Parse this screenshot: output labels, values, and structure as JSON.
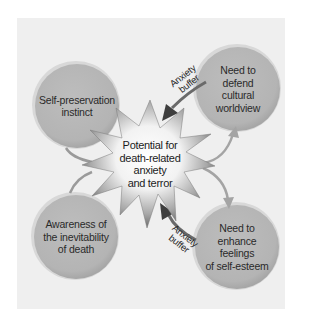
{
  "diagram": {
    "center": {
      "label": "Potential for death-related anxiety and terror",
      "lines": [
        "Potential for",
        "death-related",
        "anxiety",
        "and terror"
      ]
    },
    "nodes": [
      {
        "id": "self-preservation",
        "lines": [
          "Self-preservation",
          "instinct"
        ]
      },
      {
        "id": "awareness-death",
        "lines": [
          "Awareness of",
          "the inevitability",
          "of death"
        ]
      },
      {
        "id": "cultural-worldview",
        "lines": [
          "Need to",
          "defend",
          "cultural",
          "worldview"
        ]
      },
      {
        "id": "self-esteem",
        "lines": [
          "Need to",
          "enhance",
          "feelings",
          "of self-esteem"
        ]
      }
    ],
    "buffers": [
      {
        "lines": [
          "Anxiety",
          "buffer"
        ]
      },
      {
        "lines": [
          "Anxiety",
          "buffer"
        ]
      }
    ],
    "colors": {
      "panel": "#efefef",
      "circle": "#b9b9b9",
      "circle_rim": "#d6d6d6",
      "star_light": "#ffffff",
      "star_dark": "#6a6a6a",
      "dark_arrow": "#4a4a4a",
      "light_arrow": "#9a9a9a"
    }
  }
}
